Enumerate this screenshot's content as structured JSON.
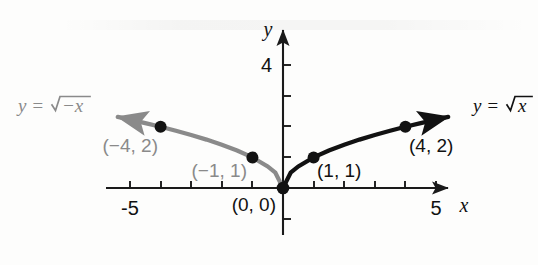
{
  "figure": {
    "title": "",
    "background_color": "#fdfdfc",
    "axes": {
      "x_axis_label": "x",
      "y_axis_label": "y",
      "x_tick_labels": [
        "-5",
        "5"
      ],
      "y_tick_labels": [
        "4"
      ],
      "x_label_neg5": "-5",
      "x_label_pos5": "5",
      "y_label_4": "4"
    },
    "curves": {
      "right": {
        "equation_label": "y = √x",
        "equation_lhs": "y =",
        "radicand": "x",
        "color": "#121212"
      },
      "left": {
        "equation_label": "y = √−x",
        "equation_lhs": "y =",
        "radicand": "−x",
        "color": "#8a8a8a"
      }
    },
    "point_labels": {
      "origin": "(0, 0)",
      "right_one": "(1, 1)",
      "right_four": "(4, 2)",
      "left_one": "(−1, 1)",
      "left_four": "(−4, 2)"
    }
  },
  "chart_data": {
    "type": "line",
    "title": "",
    "xlabel": "x",
    "ylabel": "y",
    "xlim": [
      -5.8,
      5.6
    ],
    "ylim": [
      -1.3,
      4.7
    ],
    "grid": false,
    "legend": "inline-curve-labels",
    "x_ticks": [
      -5,
      -4,
      -3,
      -2,
      -1,
      1,
      2,
      3,
      4,
      5
    ],
    "x_tick_labels_shown": {
      "-5": "-5",
      "5": "5"
    },
    "y_ticks": [
      -1,
      1,
      2,
      3,
      4
    ],
    "y_tick_labels_shown": {
      "4": "4"
    },
    "series": [
      {
        "name": "y = √x",
        "color": "#121212",
        "x": [
          0,
          0.25,
          0.5,
          1,
          1.5,
          2,
          2.5,
          3,
          3.5,
          4,
          4.5,
          5,
          5.4
        ],
        "y": [
          0,
          0.5,
          0.707,
          1,
          1.225,
          1.414,
          1.581,
          1.732,
          1.871,
          2,
          2.121,
          2.236,
          2.324
        ],
        "arrow_end": "right"
      },
      {
        "name": "y = √−x",
        "color": "#8a8a8a",
        "x": [
          0,
          -0.25,
          -0.5,
          -1,
          -1.5,
          -2,
          -2.5,
          -3,
          -3.5,
          -4,
          -4.5,
          -5,
          -5.4
        ],
        "y": [
          0,
          0.5,
          0.707,
          1,
          1.225,
          1.414,
          1.581,
          1.732,
          1.871,
          2,
          2.121,
          2.236,
          2.324
        ],
        "arrow_end": "left"
      }
    ],
    "annotated_points": [
      {
        "label": "(0, 0)",
        "x": 0,
        "y": 0,
        "color": "#121212"
      },
      {
        "label": "(1, 1)",
        "x": 1,
        "y": 1,
        "color": "#121212"
      },
      {
        "label": "(4, 2)",
        "x": 4,
        "y": 2,
        "color": "#121212"
      },
      {
        "label": "(−1, 1)",
        "x": -1,
        "y": 1,
        "color": "#8a8a8a"
      },
      {
        "label": "(−4, 2)",
        "x": -4,
        "y": 2,
        "color": "#8a8a8a"
      }
    ]
  }
}
